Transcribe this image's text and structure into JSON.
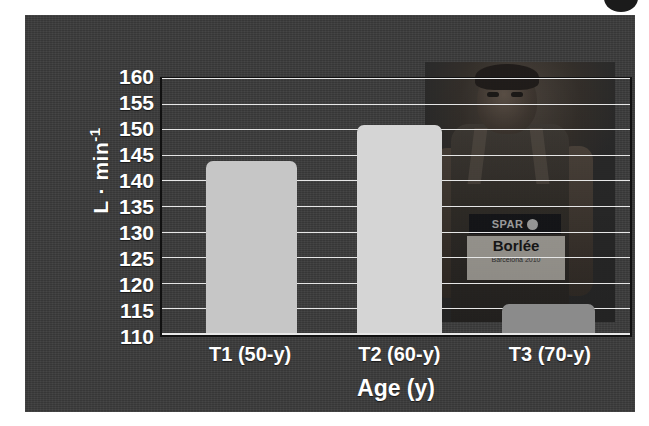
{
  "figure": {
    "background_color": "#ffffff",
    "panel_color": "#3a3a3a",
    "corner_mark_color": "#1b1b1b"
  },
  "photo": {
    "sponsor_text": "SPAR",
    "bib_name": "Borlée",
    "bib_subtext": "Barcelona 2010"
  },
  "chart_data": {
    "type": "bar",
    "title": "",
    "subtitle": "",
    "xlabel": "Age (y)",
    "ylabel": "L · min⁻¹",
    "ylabel_base": "L · min",
    "ylabel_exponent": "-1",
    "categories": [
      "T1 (50-y)",
      "T2 (60-y)",
      "T3 (70-y)"
    ],
    "values": [
      144,
      151,
      116
    ],
    "ylim": [
      110,
      160
    ],
    "ytick_step": 5,
    "ytick_labels": [
      "160",
      "155",
      "150",
      "145",
      "140",
      "135",
      "130",
      "125",
      "120",
      "115",
      "110"
    ],
    "ytick_values": [
      160,
      155,
      150,
      145,
      140,
      135,
      130,
      125,
      120,
      115,
      110
    ],
    "grid": true,
    "grid_color": "#e6e6e6",
    "legend": "none",
    "bar_colors": [
      "#c6c6c6",
      "#d5d5d5",
      "#8b8b8b"
    ],
    "bars": [
      {
        "label": "T1 (50-y)",
        "value": 144,
        "color": "#c6c6c6",
        "center_pct": 19.1,
        "width_pct": 19.3
      },
      {
        "label": "T2 (60-y)",
        "value": 151,
        "color": "#d5d5d5",
        "center_pct": 50.7,
        "width_pct": 18.2
      },
      {
        "label": "T3 (70-y)",
        "value": 116,
        "color": "#8b8b8b",
        "center_pct": 82.6,
        "width_pct": 19.8
      }
    ]
  }
}
